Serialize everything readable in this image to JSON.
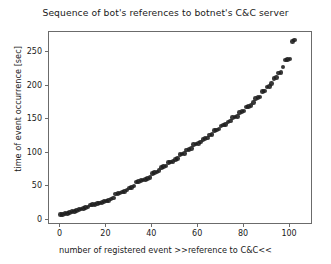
{
  "chart_data": {
    "type": "scatter",
    "title": "Sequence of bot's references to botnet's C&C server",
    "xlabel": "number of registered event >>reference to C&C<<",
    "ylabel": "time of event occurrence [sec]",
    "xlim": [
      -5,
      110
    ],
    "ylim": [
      -8,
      280
    ],
    "xticks": [
      0,
      20,
      40,
      60,
      80,
      100
    ],
    "yticks": [
      0,
      50,
      100,
      150,
      200,
      250
    ],
    "xticklabels": [
      "0",
      "20",
      "40",
      "60",
      "80",
      "100"
    ],
    "yticklabels": [
      "0",
      "50",
      "100",
      "150",
      "200",
      "250"
    ],
    "grid": false,
    "legend": null,
    "marker": "circle",
    "marker_color": "#1c1c1c",
    "series": [
      {
        "name": "reference to C&C",
        "x": [
          0,
          1,
          2,
          3,
          4,
          5,
          6,
          7,
          8,
          9,
          10,
          11,
          12,
          13,
          14,
          15,
          16,
          17,
          18,
          19,
          20,
          21,
          22,
          23,
          24,
          25,
          26,
          27,
          28,
          29,
          30,
          31,
          32,
          33,
          34,
          35,
          36,
          37,
          38,
          39,
          40,
          41,
          42,
          43,
          44,
          45,
          46,
          47,
          48,
          49,
          50,
          51,
          52,
          53,
          54,
          55,
          56,
          57,
          58,
          59,
          60,
          61,
          62,
          63,
          64,
          65,
          66,
          67,
          68,
          69,
          70,
          71,
          72,
          73,
          74,
          75,
          76,
          77,
          78,
          79,
          80,
          81,
          82,
          83,
          84,
          85,
          86,
          87,
          88,
          89,
          90,
          91,
          92,
          93,
          94,
          95,
          96,
          97,
          98,
          99,
          100,
          101,
          102
        ],
        "y": [
          8,
          8,
          9,
          9,
          11,
          12,
          12,
          14,
          15,
          16,
          17,
          18,
          19,
          22,
          23,
          23,
          24,
          25,
          26,
          27,
          28,
          29,
          31,
          32,
          38,
          39,
          40,
          41,
          42,
          44,
          47,
          48,
          50,
          56,
          57,
          58,
          59,
          60,
          61,
          63,
          69,
          70,
          71,
          73,
          78,
          79,
          80,
          85,
          86,
          87,
          90,
          91,
          97,
          98,
          99,
          104,
          105,
          106,
          112,
          113,
          114,
          116,
          120,
          121,
          122,
          126,
          127,
          133,
          134,
          135,
          140,
          141,
          142,
          146,
          147,
          152,
          153,
          154,
          160,
          161,
          162,
          168,
          169,
          170,
          175,
          181,
          182,
          183,
          191,
          192,
          198,
          199,
          203,
          211,
          212,
          219,
          220,
          228,
          238,
          239,
          240,
          266,
          268
        ]
      }
    ]
  }
}
